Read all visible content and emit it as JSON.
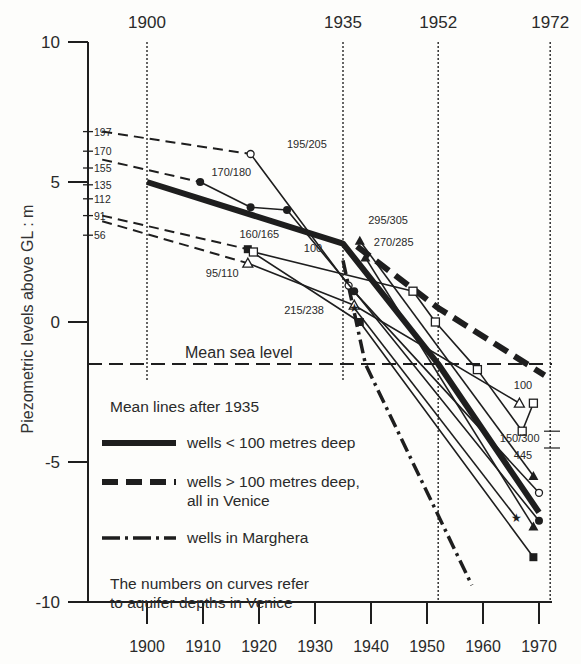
{
  "chart_data": {
    "type": "line",
    "title": "",
    "xlabel": "",
    "ylabel": "Piezometric levels above GL : m",
    "xlim": [
      1890,
      1973
    ],
    "ylim": [
      -10,
      10
    ],
    "x_ticks": [
      1900,
      1910,
      1920,
      1930,
      1940,
      1950,
      1960,
      1970
    ],
    "y_ticks": [
      10,
      5,
      0,
      -5,
      -10
    ],
    "reference_years": [
      {
        "label": "1900",
        "x": 1900
      },
      {
        "label": "1935",
        "x": 1935
      },
      {
        "label": "1952",
        "x": 1952
      },
      {
        "label": "1972",
        "x": 1972
      }
    ],
    "mean_sea_level": {
      "label": "Mean sea level",
      "y": -1.5
    },
    "left_depth_ticks": [
      {
        "label": "197",
        "y": 6.8
      },
      {
        "label": "170",
        "y": 6.1
      },
      {
        "label": "155",
        "y": 5.5
      },
      {
        "label": "135",
        "y": 4.9
      },
      {
        "label": "112",
        "y": 4.4
      },
      {
        "label": "91",
        "y": 3.8
      },
      {
        "label": "56",
        "y": 3.1
      }
    ],
    "right_ticks": [
      {
        "y": -3.9
      },
      {
        "y": -4.5
      }
    ],
    "curve_labels": [
      {
        "text": "195/205",
        "x": 1925,
        "y": 6.2
      },
      {
        "text": "170/180",
        "x": 1911.5,
        "y": 5.2
      },
      {
        "text": "160/165",
        "x": 1916.5,
        "y": 3.0
      },
      {
        "text": "100",
        "x": 1928,
        "y": 2.5
      },
      {
        "text": "95/110",
        "x": 1910.5,
        "y": 1.6
      },
      {
        "text": "215/238",
        "x": 1924.5,
        "y": 0.3
      },
      {
        "text": "295/305",
        "x": 1939.5,
        "y": 3.5
      },
      {
        "text": "270/285",
        "x": 1940.5,
        "y": 2.7
      },
      {
        "text": "100",
        "x": 1965.5,
        "y": -2.4
      },
      {
        "text": "150/300",
        "x": 1963,
        "y": -4.3
      },
      {
        "text": "445",
        "x": 1965.5,
        "y": -4.9
      }
    ],
    "series": [
      {
        "name": "wells < 100 metres deep (mean line)",
        "style": "thick",
        "x": [
          1900,
          1935,
          1952,
          1970
        ],
        "y": [
          5.0,
          2.8,
          -1.5,
          -6.8
        ]
      },
      {
        "name": "wells > 100 metres deep, all in Venice (mean line)",
        "style": "thickdash",
        "x": [
          1937.5,
          1952,
          1971
        ],
        "y": [
          2.7,
          0.5,
          -1.9
        ]
      },
      {
        "name": "wells in Marghera (mean line)",
        "style": "dashdot",
        "x": [
          1935,
          1939,
          1958
        ],
        "y": [
          2.2,
          -1.5,
          -9.4
        ]
      },
      {
        "name": "195/205",
        "style": "thin",
        "marker": "circle-open",
        "x": [
          1918.5,
          1936,
          1970
        ],
        "y": [
          6.0,
          1.3,
          -6.1
        ]
      },
      {
        "name": "170/180",
        "style": "thin",
        "marker": "circle-filled",
        "x": [
          1909.5,
          1918.5,
          1925,
          1937,
          1970
        ],
        "y": [
          5.0,
          4.1,
          4.0,
          1.1,
          -7.1
        ]
      },
      {
        "name": "160/165",
        "style": "thin",
        "marker": "square-filled",
        "x": [
          1918,
          1938,
          1969
        ],
        "y": [
          2.6,
          0.0,
          -8.4
        ]
      },
      {
        "name": "100",
        "style": "thin",
        "marker": "square-open",
        "x": [
          1919,
          1947.5,
          1951.5,
          1959,
          1967,
          1969
        ],
        "y": [
          2.5,
          1.1,
          0.0,
          -1.7,
          -3.9,
          -2.9
        ]
      },
      {
        "name": "95/110",
        "style": "thin",
        "marker": "triangle-open",
        "x": [
          1918,
          1937,
          1966.5
        ],
        "y": [
          2.1,
          0.6,
          -2.9
        ]
      },
      {
        "name": "215/238",
        "style": "thin",
        "marker": "star",
        "x": [
          1937,
          1966
        ],
        "y": [
          0.5,
          -7.0
        ]
      },
      {
        "name": "295/305",
        "style": "thin",
        "marker": "triangle-filled",
        "x": [
          1938,
          1969
        ],
        "y": [
          2.9,
          -5.5
        ]
      },
      {
        "name": "270/285",
        "style": "thin",
        "marker": "triangle-filled",
        "x": [
          1939,
          1969
        ],
        "y": [
          2.3,
          -7.3
        ]
      }
    ],
    "dashed_extrapolations": [
      {
        "from_label": "197",
        "x": [
          1892,
          1918.5
        ],
        "y": [
          6.8,
          6.0
        ]
      },
      {
        "from_label": "155",
        "x": [
          1892,
          1909.5
        ],
        "y": [
          5.8,
          5.0
        ]
      },
      {
        "from_label": "91",
        "x": [
          1892,
          1918
        ],
        "y": [
          3.8,
          2.6
        ]
      },
      {
        "from_label": "56",
        "x": [
          1892,
          1918
        ],
        "y": [
          3.6,
          2.1
        ]
      }
    ],
    "legend": {
      "title": "Mean lines after 1935",
      "entries": [
        {
          "style": "thick",
          "label": "wells < 100 metres deep"
        },
        {
          "style": "thickdash",
          "label": "wells > 100 metres deep,",
          "label2": "all in Venice"
        },
        {
          "style": "dashdot",
          "label": "wells in Marghera"
        }
      ],
      "note_line1": "The numbers on curves refer",
      "note_line2": "to aquifer depths in Venice"
    },
    "grid": false
  }
}
